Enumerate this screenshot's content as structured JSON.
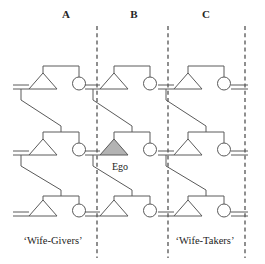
{
  "figure": {
    "type": "kinship-diagram",
    "width": 265,
    "height": 264,
    "background": "#ffffff"
  },
  "columns": [
    {
      "id": "A",
      "label": "A",
      "x": 66,
      "label_y": 18
    },
    {
      "id": "B",
      "label": "B",
      "x": 134,
      "label_y": 18
    },
    {
      "id": "C",
      "label": "C",
      "x": 206,
      "label_y": 18
    }
  ],
  "group_labels": [
    {
      "id": "wife-givers",
      "text": "‘Wife-Givers’",
      "x": 53,
      "y": 241
    },
    {
      "id": "wife-takers",
      "text": "‘Wife-Takers’",
      "x": 205,
      "y": 241
    }
  ],
  "ego": {
    "label": "Ego",
    "label_x": 112,
    "label_y": 168,
    "fill_color": "#b3b3b3",
    "column": "B",
    "generation": 2
  },
  "colors": {
    "line": "#5a5a5a",
    "boundary": "#333333",
    "ego_fill": "#b3b3b3",
    "shape_fill": "#ffffff",
    "text": "#1c1c1c"
  },
  "boundaries": [
    {
      "id": "boundary-left",
      "x": 97,
      "y1": 26,
      "y2": 258
    },
    {
      "id": "boundary-mid",
      "x": 168,
      "y1": 26,
      "y2": 258
    },
    {
      "id": "boundary-right",
      "x": 245,
      "y1": 26,
      "y2": 258
    }
  ],
  "generations": [
    {
      "id": "gen-1",
      "baseline_y": 89
    },
    {
      "id": "gen-2",
      "baseline_y": 155
    },
    {
      "id": "gen-3",
      "baseline_y": 216
    }
  ],
  "families": [
    {
      "id": "fam-A1",
      "column": "A",
      "generation": 1,
      "male_x": 43,
      "female_x": 79,
      "baseline_y": 89,
      "is_ego": false
    },
    {
      "id": "fam-B1",
      "column": "B",
      "generation": 1,
      "male_x": 114,
      "female_x": 150,
      "baseline_y": 89,
      "is_ego": false
    },
    {
      "id": "fam-C1",
      "column": "C",
      "generation": 1,
      "male_x": 188,
      "female_x": 224,
      "baseline_y": 89,
      "is_ego": false
    },
    {
      "id": "fam-A2",
      "column": "A",
      "generation": 2,
      "male_x": 43,
      "female_x": 79,
      "baseline_y": 155,
      "is_ego": false
    },
    {
      "id": "fam-B2",
      "column": "B",
      "generation": 2,
      "male_x": 114,
      "female_x": 150,
      "baseline_y": 155,
      "is_ego": true
    },
    {
      "id": "fam-C2",
      "column": "C",
      "generation": 2,
      "male_x": 188,
      "female_x": 224,
      "baseline_y": 155,
      "is_ego": false
    },
    {
      "id": "fam-A3",
      "column": "A",
      "generation": 3,
      "male_x": 43,
      "female_x": 79,
      "baseline_y": 216,
      "is_ego": false
    },
    {
      "id": "fam-B3",
      "column": "B",
      "generation": 3,
      "male_x": 114,
      "female_x": 150,
      "baseline_y": 216,
      "is_ego": false
    },
    {
      "id": "fam-C3",
      "column": "C",
      "generation": 3,
      "male_x": 188,
      "female_x": 224,
      "baseline_y": 216,
      "is_ego": false
    }
  ],
  "symbols": {
    "male": "triangle",
    "female": "circle",
    "marriage": "equals-double-line",
    "descent": "line",
    "group_boundary": "vertical-dashed-line"
  }
}
